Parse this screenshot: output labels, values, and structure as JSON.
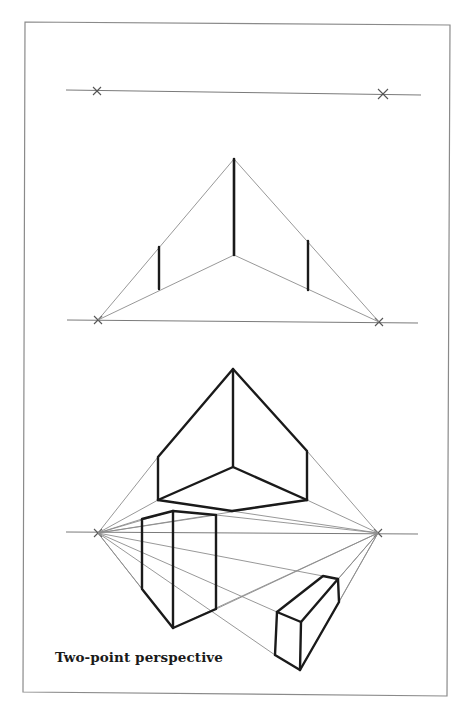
{
  "figure": {
    "caption": "Two-point perspective",
    "colors": {
      "background": "#ffffff",
      "frame": "#8a8a8a",
      "construction_lines": "#8c8c8c",
      "object_edges": "#1a1a1a"
    },
    "panels": [
      {
        "name": "horizon-with-vanishing-points",
        "horizon_y": 92,
        "vanishing_points": [
          {
            "label": "left",
            "x": 97,
            "y": 91
          },
          {
            "label": "right",
            "x": 383,
            "y": 94
          }
        ]
      },
      {
        "name": "corner-edge-construction",
        "horizon_y": 321,
        "vanishing_points": [
          {
            "label": "left",
            "x": 98,
            "y": 320
          },
          {
            "label": "right",
            "x": 379,
            "y": 322
          }
        ],
        "front_edge": {
          "x": 234,
          "top": 159,
          "bottom": 255
        },
        "side_edges": [
          {
            "x": 159,
            "top": 247,
            "bottom": 289
          },
          {
            "x": 308,
            "top": 241,
            "bottom": 290
          }
        ]
      },
      {
        "name": "boxes-in-two-point-perspective",
        "horizon_y": 533,
        "vanishing_points": [
          {
            "label": "left",
            "x": 98,
            "y": 533
          },
          {
            "label": "right",
            "x": 378,
            "y": 533
          }
        ],
        "objects": [
          {
            "name": "box-above-horizon",
            "view": "from below"
          },
          {
            "name": "tall-box-below-horizon",
            "view": "from above"
          },
          {
            "name": "low-box-below-horizon",
            "view": "from above"
          }
        ]
      }
    ]
  }
}
